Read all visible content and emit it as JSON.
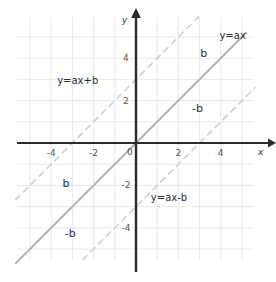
{
  "chart_data": {
    "type": "line",
    "title": "",
    "xlabel": "x",
    "ylabel": "y",
    "xlim": [
      -5.67,
      5.62
    ],
    "ylim": [
      -5.57,
      6.0
    ],
    "grid": true,
    "grid_step": 1,
    "legend_position": "inline-annotations",
    "axis_arrows": true,
    "x_ticks": [
      -4,
      -2,
      0,
      2,
      4
    ],
    "x_tick_labels": [
      "-4",
      "-2",
      "0",
      "2",
      "4"
    ],
    "y_ticks": [
      4,
      2,
      -2,
      -4
    ],
    "y_tick_labels": [
      "4",
      "2",
      "-2",
      "-4"
    ],
    "origin_label": "0",
    "series": [
      {
        "name": "y=ax",
        "style": "solid",
        "color": "#b4b4b4",
        "slope": 1,
        "intercept": 0,
        "x": [
          -5.67,
          5.2
        ],
        "y": [
          -5.67,
          5.2
        ]
      },
      {
        "name": "y=ax+b",
        "style": "dashed",
        "color": "#cfcfcf",
        "slope": 1,
        "intercept": 3,
        "x": [
          -5.67,
          2.95
        ],
        "y": [
          -2.67,
          5.95
        ]
      },
      {
        "name": "y=ax-b",
        "style": "dashed",
        "color": "#cfcfcf",
        "slope": 1,
        "intercept": -3,
        "x": [
          -2.5,
          5.62
        ],
        "y": [
          -5.5,
          2.62
        ]
      }
    ],
    "annotations": [
      {
        "id": "eq-y-ax",
        "text": "y=ax",
        "x": 4.55,
        "y": 5.05
      },
      {
        "id": "eq-y-ax-plus-b",
        "text": "y=ax+b",
        "x": -2.75,
        "y": 2.95
      },
      {
        "id": "eq-y-ax-minus-b",
        "text": "y=ax-b",
        "x": 1.55,
        "y": -2.55
      },
      {
        "id": "offset-b-upper",
        "text": "b",
        "x": 3.2,
        "y": 4.2
      },
      {
        "id": "offset-minus-b-upper",
        "text": "-b",
        "x": 2.9,
        "y": 1.65
      },
      {
        "id": "offset-b-lower",
        "text": "b",
        "x": -3.3,
        "y": -1.9
      },
      {
        "id": "offset-minus-b-lower",
        "text": "-b",
        "x": -3.1,
        "y": -4.25
      }
    ]
  },
  "figure": {
    "y_axis_label": "y",
    "x_axis_label": "x"
  }
}
